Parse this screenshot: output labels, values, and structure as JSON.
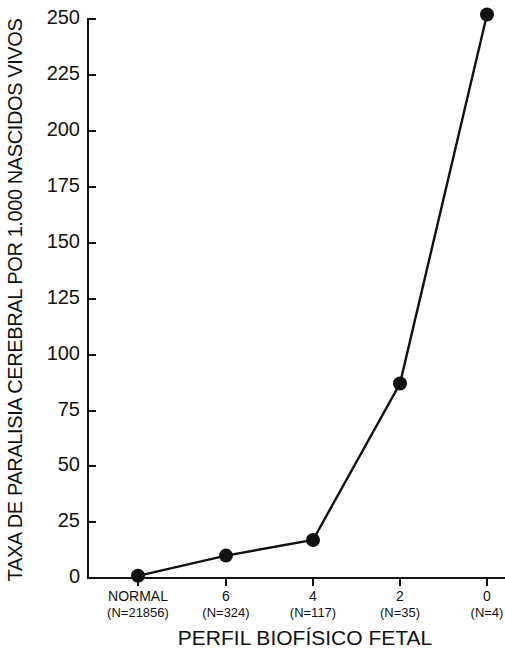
{
  "chart_data": {
    "type": "line",
    "title": "",
    "xlabel": "PERFIL BIOFÍSICO FETAL",
    "ylabel": "TAXA DE PARALISIA CEREBRAL POR 1.000 NASCIDOS VIVOS",
    "categories": [
      "NORMAL",
      "6",
      "4",
      "2",
      "0"
    ],
    "category_sublabels": [
      "(N=21856)",
      "(N=324)",
      "(N=117)",
      "(N=35)",
      "(N=4)"
    ],
    "values": [
      1,
      10,
      17,
      87,
      252
    ],
    "series": [
      {
        "name": "Taxa de paralisia cerebral por 1.000 nascidos vivos",
        "values": [
          1,
          10,
          17,
          87,
          252
        ]
      }
    ],
    "ylim": [
      0,
      250
    ],
    "ytick_labels": [
      "0",
      "25",
      "50",
      "75",
      "100",
      "125",
      "150",
      "175",
      "200",
      "225",
      "250"
    ],
    "ytick_values": [
      0,
      25,
      50,
      75,
      100,
      125,
      150,
      175,
      200,
      225,
      250
    ],
    "grid": false,
    "legend": false,
    "legend_position": "none",
    "marker": "filled-circle",
    "line_color": "#111111",
    "marker_color": "#111111",
    "background_color": "#ffffff"
  }
}
